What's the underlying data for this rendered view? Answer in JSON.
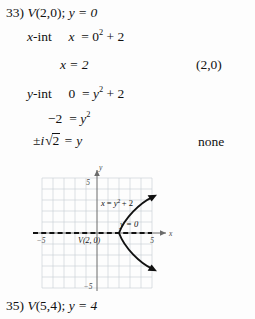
{
  "document": {
    "type": "math-worksheet-solution",
    "background_color": "#fdfdfd",
    "text_color": "#111111"
  },
  "problem": {
    "number": "33)",
    "vertex_statement": "V(2,0); y = 0",
    "vertex_label": "V",
    "vertex_point": "(2,0)",
    "axis_equation": "y = 0"
  },
  "work_lines": [
    {
      "label": "x-int",
      "label_var": "x",
      "label_rest": "-int",
      "equation_lhs": "x",
      "equation_rhs_base": "0",
      "equation_rhs_exp": "2",
      "equation_rhs_tail": "+ 2",
      "full_text": "x-int   x = 0² + 2"
    },
    {
      "label": "",
      "equation": "x = 2",
      "full_text": "x = 2"
    },
    {
      "label": "y-int",
      "label_var": "y",
      "label_rest": "-int",
      "equation_lhs": "0",
      "equation_rhs_base": "y",
      "equation_rhs_exp": "2",
      "equation_rhs_tail": "+ 2",
      "full_text": "y-int   0 = y² + 2"
    },
    {
      "label": "",
      "equation_lhs": "−2",
      "equation_rhs_base": "y",
      "equation_rhs_exp": "2",
      "full_text": "−2 = y²"
    },
    {
      "label": "",
      "prefix": "±i",
      "radical_value": "2",
      "equation_tail": "= y",
      "full_text": "±i√2 = y"
    }
  ],
  "answers": {
    "x_intercept": "(2,0)",
    "y_intercept": "none"
  },
  "graph": {
    "curve_label": "x = y² + 2",
    "curve_label_lhs": "x",
    "curve_label_eq": "=",
    "curve_label_base": "y",
    "curve_label_exp": "2",
    "curve_label_tail": "+ 2",
    "axis_line_label": "y = 0",
    "vertex_annotation": "V(2, 0)",
    "x_axis_label": "x",
    "y_axis_label": "y",
    "tick_labels": {
      "x_negative": "−5",
      "x_positive": "5",
      "y_positive": "5",
      "y_negative": "−5"
    },
    "x_range": [
      -5,
      5
    ],
    "y_range": [
      -5,
      5
    ],
    "grid": true,
    "grid_color": "#c8cdd4",
    "axis_color": "#6b6b6b",
    "curve_color": "#111111",
    "dashed_line_color": "#111111"
  },
  "next_problem": {
    "number": "35)",
    "statement": "V(5,4); y = 4",
    "vertex_label": "V",
    "vertex_point": "(5,4)",
    "axis_equation": "y = 4"
  }
}
